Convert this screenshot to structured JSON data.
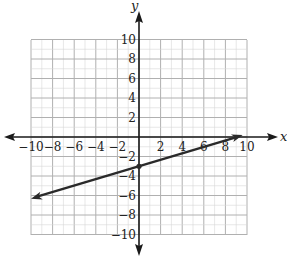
{
  "chart_data": {
    "type": "line",
    "title": "",
    "xlabel": "x",
    "ylabel": "y",
    "xlim": [
      -10,
      10
    ],
    "ylim": [
      -10,
      10
    ],
    "grid": true,
    "grid_step": 1,
    "x_ticks": [
      -10,
      -8,
      -6,
      -4,
      -2,
      2,
      4,
      6,
      8,
      10
    ],
    "y_ticks": [
      10,
      8,
      6,
      4,
      2,
      -2,
      -4,
      -6,
      -8,
      -10
    ],
    "x_tick_labels": [
      "−10",
      "−8",
      "−6",
      "−4",
      "−2",
      "2",
      "4",
      "6",
      "8",
      "10"
    ],
    "y_tick_labels": [
      "10",
      "8",
      "6",
      "4",
      "2",
      "−2",
      "−4",
      "−6",
      "−8",
      "−10"
    ],
    "series": [
      {
        "name": "line",
        "equation": "y = (1/3)x - 3",
        "slope": 0.3333,
        "y_intercept": -3,
        "x": [
          -10,
          0,
          9,
          9.6
        ],
        "y": [
          -6.33,
          -3,
          0,
          0.2
        ],
        "arrows_both_ends": true,
        "marked_point": [
          0,
          -3
        ]
      }
    ],
    "legend": "none"
  },
  "labels": {
    "x_axis": "x",
    "y_axis": "y"
  },
  "colors": {
    "grid": "#b0b0b0",
    "axis": "#1a1a1a",
    "line": "#2a2a2a",
    "background": "#ffffff"
  }
}
